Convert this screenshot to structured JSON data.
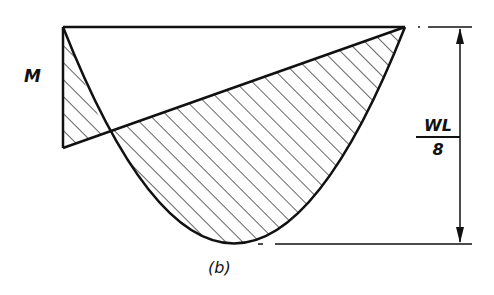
{
  "figure": {
    "caption": "(b)",
    "moment_label": "M",
    "dimension_label": {
      "numerator": "WL",
      "denominator": "8"
    },
    "stroke_color": "#111111",
    "background": "#ffffff"
  },
  "elements": [
    "baseline (horizontal top line)",
    "parabolic simple-span moment diagram, depth WL/8",
    "end-moment triangle from M at left support to zero at right support",
    "hatched net moment regions",
    "vertical dimension line with arrows"
  ]
}
